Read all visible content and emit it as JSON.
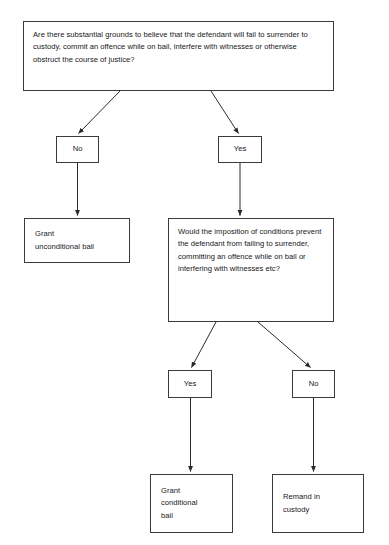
{
  "diagram": {
    "background_color": "#ffffff",
    "line_color": "#3b3b3b",
    "text_color": "#17171a",
    "nodes": {
      "question_1": "Are there substantial grounds to believe that the defendant will fail to surrender to custody, commit an offence while on bail, interfere with witnesses or otherwise obstruct the course of justice?",
      "answer_no_1": "No",
      "answer_yes_1": "Yes",
      "grant_unconditional_bail": "Grant\nunconditional bail",
      "question_2": "Would the imposition of conditions prevent the defendant from failing to surrender, committing an offence while on bail or interfering with witnesses etc?",
      "answer_yes_2": "Yes",
      "answer_no_2": "No",
      "grant_conditional_bail": "Grant\nconditional\nbail",
      "remand_in_custody": "Remand in\ncustody"
    },
    "edges": [
      {
        "from": "question_1",
        "to": "answer_no_1",
        "label": ""
      },
      {
        "from": "question_1",
        "to": "answer_yes_1",
        "label": ""
      },
      {
        "from": "answer_no_1",
        "to": "grant_unconditional_bail",
        "label": ""
      },
      {
        "from": "answer_yes_1",
        "to": "question_2",
        "label": ""
      },
      {
        "from": "question_2",
        "to": "answer_yes_2",
        "label": ""
      },
      {
        "from": "question_2",
        "to": "answer_no_2",
        "label": ""
      },
      {
        "from": "answer_yes_2",
        "to": "grant_conditional_bail",
        "label": ""
      },
      {
        "from": "answer_no_2",
        "to": "remand_in_custody",
        "label": ""
      }
    ]
  }
}
